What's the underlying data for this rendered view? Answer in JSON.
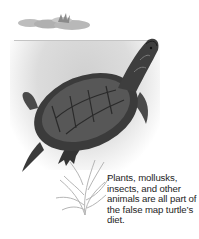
{
  "illustration": {
    "subject": "false map turtle",
    "elements": [
      "lily-pad",
      "water-surface",
      "turtle",
      "aquatic-plant"
    ],
    "palette": {
      "background": "#ffffff",
      "water": "#d6d6d6",
      "shell_dark": "#2e2e2e",
      "shell_mid": "#5a5a5a",
      "plant": "#b8b8b8",
      "text": "#1e1e1e"
    }
  },
  "caption": {
    "text": "Plants, mollusks, insects, and other animals are all part of the false map turtle’s diet."
  }
}
